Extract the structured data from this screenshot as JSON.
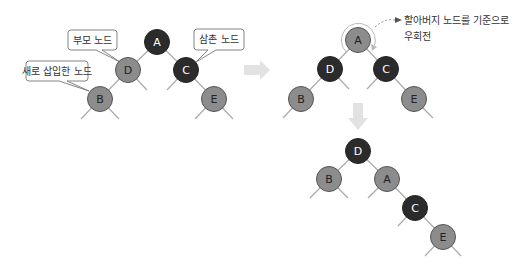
{
  "colors": {
    "red_node": "#8c8c8c",
    "black_node": "#2b2b2b",
    "node_stroke": "#555555",
    "edge": "#aaaaaa",
    "arrow": "#e2e2e2",
    "callout_stroke": "#777777",
    "label_dark": "#222222",
    "label_light": "#ffffff"
  },
  "diagram": {
    "before": {
      "nodes": [
        {
          "id": "A",
          "label": "A",
          "color": "black",
          "x": 157,
          "y": 42
        },
        {
          "id": "D",
          "label": "D",
          "color": "red",
          "x": 128,
          "y": 70
        },
        {
          "id": "C",
          "label": "C",
          "color": "black",
          "x": 186,
          "y": 70
        },
        {
          "id": "B",
          "label": "B",
          "color": "red",
          "x": 100,
          "y": 99
        },
        {
          "id": "E",
          "label": "E",
          "color": "red",
          "x": 214,
          "y": 99
        }
      ],
      "callouts": [
        {
          "text": "부모 노드",
          "target": "D"
        },
        {
          "text": "새로 삽입한 노드",
          "target": "B"
        },
        {
          "text": "삼촌 노드",
          "target": "C"
        }
      ]
    },
    "recolored": {
      "nodes": [
        {
          "id": "A",
          "label": "A",
          "color": "red",
          "x": 358,
          "y": 40
        },
        {
          "id": "D",
          "label": "D",
          "color": "black",
          "x": 330,
          "y": 69
        },
        {
          "id": "C",
          "label": "C",
          "color": "black",
          "x": 386,
          "y": 69
        },
        {
          "id": "B",
          "label": "B",
          "color": "red",
          "x": 301,
          "y": 99
        },
        {
          "id": "E",
          "label": "E",
          "color": "red",
          "x": 414,
          "y": 99
        }
      ],
      "note_line1": "할아버지 노드를 기준으로",
      "note_line2": "우회전"
    },
    "rotated": {
      "nodes": [
        {
          "id": "D",
          "label": "D",
          "color": "black",
          "x": 358,
          "y": 151
        },
        {
          "id": "B",
          "label": "B",
          "color": "red",
          "x": 329,
          "y": 179
        },
        {
          "id": "A",
          "label": "A",
          "color": "red",
          "x": 387,
          "y": 179
        },
        {
          "id": "C",
          "label": "C",
          "color": "black",
          "x": 415,
          "y": 208
        },
        {
          "id": "E",
          "label": "E",
          "color": "red",
          "x": 443,
          "y": 237
        }
      ]
    }
  }
}
